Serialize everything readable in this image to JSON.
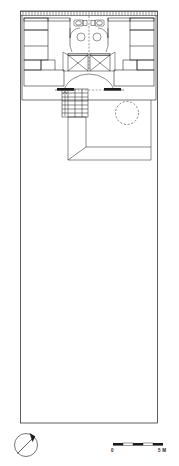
{
  "drawing": {
    "type": "architectural-floor-plan",
    "description": "Measured plan of a courtyard house: built rooms across the north range, an open courtyard occupying the long southern plot.",
    "orientation": "north-arrow points to upper-left",
    "line_color": "#1a1a1a",
    "background_color": "#ffffff"
  },
  "scale_bar": {
    "start_label": "0",
    "end_label": "5 M",
    "units": "metres",
    "total_length_m": 5,
    "segments": 4,
    "segment_fills": [
      "solid",
      "open",
      "solid",
      "open",
      "solid"
    ]
  },
  "north_arrow": {
    "label": "N",
    "style": "circle-with-diagonal-arrow",
    "bearing": "upper-left"
  },
  "plot": {
    "name": "site-boundary",
    "shape": "long narrow rectangle",
    "courtyard_name": "open-courtyard"
  },
  "rooms": [
    {
      "id": "room-nw",
      "name": "north-west-room"
    },
    {
      "id": "room-w",
      "name": "west-room"
    },
    {
      "id": "room-sw",
      "name": "south-west-room"
    },
    {
      "id": "room-ne",
      "name": "north-east-room"
    },
    {
      "id": "room-e",
      "name": "east-room"
    },
    {
      "id": "room-se",
      "name": "south-east-room"
    },
    {
      "id": "central-hall",
      "name": "central-hall"
    },
    {
      "id": "veranda",
      "name": "veranda"
    }
  ],
  "fixtures": [
    {
      "id": "wc-left",
      "name": "toilet-fixture-left"
    },
    {
      "id": "wc-right",
      "name": "toilet-fixture-right"
    },
    {
      "id": "basin-left",
      "name": "wash-basin-left"
    },
    {
      "id": "basin-right",
      "name": "wash-basin-right"
    },
    {
      "id": "bed-left",
      "name": "bed-left"
    },
    {
      "id": "bed-right",
      "name": "bed-right"
    },
    {
      "id": "stair",
      "name": "staircase",
      "treads": 7
    },
    {
      "id": "round-table",
      "name": "round-table-dashed"
    },
    {
      "id": "arc-threshold",
      "name": "arched-threshold"
    }
  ],
  "walls": {
    "north_wall_style": "hatched-masonry",
    "thickness_note": "double-line"
  }
}
